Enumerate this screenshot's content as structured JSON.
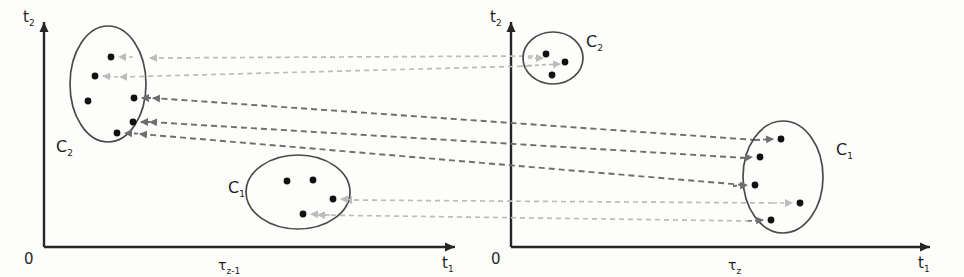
{
  "figure": {
    "type": "diagram",
    "colors": {
      "axis": "#262626",
      "ellipse": "#4a4a4a",
      "point": "#111111",
      "arrow_dark": "#6e6e6e",
      "arrow_light": "#b9b9b9",
      "background": "#fdfdfb"
    }
  },
  "panels": [
    {
      "id": "left",
      "name": "snapshot-tau-z-minus-1",
      "origin_label": "0",
      "y_axis_label": "t",
      "y_axis_sub": "2",
      "x_axis_label": "t",
      "x_axis_sub": "1",
      "x_tick_label": "τ",
      "x_tick_sub": "z-1",
      "clusters": [
        {
          "name": "C2",
          "label": "C",
          "label_sub": "2",
          "label_x": 56,
          "label_y": 152,
          "shape": "ellipse",
          "cx": 108,
          "cy": 84,
          "rx": 38,
          "ry": 58,
          "points": [
            {
              "x": 111,
              "y": 57
            },
            {
              "x": 95,
              "y": 76
            },
            {
              "x": 88,
              "y": 101
            },
            {
              "x": 134,
              "y": 98
            },
            {
              "x": 133,
              "y": 122
            },
            {
              "x": 117,
              "y": 133
            }
          ]
        },
        {
          "name": "C1",
          "label": "C",
          "label_sub": "1",
          "label_x": 228,
          "label_y": 193,
          "shape": "ellipse",
          "cx": 298,
          "cy": 192,
          "rx": 52,
          "ry": 37,
          "points": [
            {
              "x": 287,
              "y": 181
            },
            {
              "x": 313,
              "y": 180
            },
            {
              "x": 333,
              "y": 199
            },
            {
              "x": 303,
              "y": 214
            }
          ]
        }
      ]
    },
    {
      "id": "right",
      "name": "snapshot-tau-z",
      "origin_label": "0",
      "y_axis_label": "t",
      "y_axis_sub": "2",
      "x_axis_label": "t",
      "x_axis_sub": "1",
      "x_tick_label": "τ",
      "x_tick_sub": "z",
      "clusters": [
        {
          "name": "C2",
          "label": "C",
          "label_sub": "2",
          "label_x": 586,
          "label_y": 47,
          "shape": "circle",
          "cx": 553,
          "cy": 58,
          "rx": 30,
          "ry": 26,
          "points": [
            {
              "x": 546,
              "y": 54
            },
            {
              "x": 565,
              "y": 62
            },
            {
              "x": 552,
              "y": 75
            }
          ]
        },
        {
          "name": "C1",
          "label": "C",
          "label_sub": "1",
          "label_x": 836,
          "label_y": 155,
          "shape": "ellipse",
          "cx": 783,
          "cy": 177,
          "rx": 40,
          "ry": 56,
          "points": [
            {
              "x": 781,
              "y": 139
            },
            {
              "x": 760,
              "y": 157
            },
            {
              "x": 755,
              "y": 185
            },
            {
              "x": 800,
              "y": 203
            },
            {
              "x": 771,
              "y": 220
            }
          ]
        }
      ]
    }
  ],
  "transitions": [
    {
      "name": "c2-to-c2-a",
      "from": "right-C2",
      "to": "left-C2",
      "style": "light"
    },
    {
      "name": "c2-to-c2-b",
      "from": "right-C2",
      "to": "left-C2",
      "style": "light"
    },
    {
      "name": "c1-to-c2-a",
      "from": "right-C1",
      "to": "left-C2",
      "style": "dark"
    },
    {
      "name": "c1-to-c2-b",
      "from": "right-C1",
      "to": "left-C2",
      "style": "dark"
    },
    {
      "name": "c1-to-c2-c",
      "from": "right-C1",
      "to": "left-C2",
      "style": "dark"
    },
    {
      "name": "c1-to-c1-a",
      "from": "right-C1",
      "to": "left-C1",
      "style": "light"
    },
    {
      "name": "c1-to-c1-b",
      "from": "right-C1",
      "to": "left-C1",
      "style": "light"
    }
  ]
}
